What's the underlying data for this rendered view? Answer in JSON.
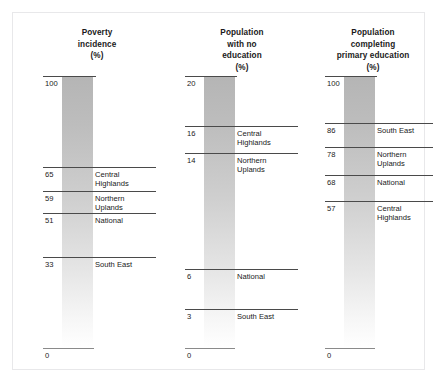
{
  "figure": {
    "border_color": "#e8e8ea",
    "bar_color_top": "#b5b5b5",
    "bar_color_bottom": "#ffffff",
    "tick_color": "#4a4a4a"
  },
  "chart_data": {
    "type": "bar",
    "title": "",
    "panel_count": 3,
    "panels": [
      {
        "title": "Poverty\nincidence\n(%)",
        "title_lines": [
          "Poverty",
          "incidence",
          "(%)"
        ],
        "ylabel": "Poverty incidence (%)",
        "ylim": [
          0,
          100
        ],
        "categories": [
          "Central Highlands",
          "Northern Uplands",
          "National",
          "South East"
        ],
        "values": [
          65,
          59,
          51,
          33
        ],
        "top_value": 100,
        "base_value": 0,
        "ticks": [
          {
            "value": "100",
            "label": "",
            "y": 75
          },
          {
            "value": "65",
            "label": "Central\nHighlands",
            "y": 166
          },
          {
            "value": "59",
            "label": "Northern\nUplands",
            "y": 190
          },
          {
            "value": "51",
            "label": "National",
            "y": 212
          },
          {
            "value": "33",
            "label": "South East",
            "y": 256
          },
          {
            "value": "0",
            "label": "",
            "y": 347
          }
        ]
      },
      {
        "title": "Population\nwith no\neducation\n(%)",
        "title_lines": [
          "Population",
          "with no",
          "education",
          "(%)"
        ],
        "ylabel": "Population with no education (%)",
        "ylim": [
          0,
          20
        ],
        "categories": [
          "Central Highlands",
          "Northern Uplands",
          "National",
          "South East"
        ],
        "values": [
          16,
          14,
          6,
          3
        ],
        "top_value": 20,
        "base_value": 0,
        "ticks": [
          {
            "value": "20",
            "label": "",
            "y": 75
          },
          {
            "value": "16",
            "label": "Central\nHighlands",
            "y": 125
          },
          {
            "value": "14",
            "label": "Northern\nUplands",
            "y": 152
          },
          {
            "value": "6",
            "label": "National",
            "y": 268
          },
          {
            "value": "3",
            "label": "South East",
            "y": 308
          },
          {
            "value": "0",
            "label": "",
            "y": 347
          }
        ]
      },
      {
        "title": "Population\ncompleting\nprimary education\n(%)",
        "title_lines": [
          "Population",
          "completing",
          "primary education",
          "(%)"
        ],
        "ylabel": "Population completing primary education (%)",
        "ylim": [
          0,
          100
        ],
        "categories": [
          "South East",
          "Northern Uplands",
          "National",
          "Central Highlands"
        ],
        "values": [
          86,
          78,
          68,
          57
        ],
        "top_value": 100,
        "base_value": 0,
        "ticks": [
          {
            "value": "100",
            "label": "",
            "y": 75
          },
          {
            "value": "86",
            "label": "South East",
            "y": 122
          },
          {
            "value": "78",
            "label": "Northern\nUplands",
            "y": 146
          },
          {
            "value": "68",
            "label": "National",
            "y": 174
          },
          {
            "value": "57",
            "label": "Central\nHighlands",
            "y": 200
          }
        ]
      }
    ],
    "baseline_label": "0"
  }
}
